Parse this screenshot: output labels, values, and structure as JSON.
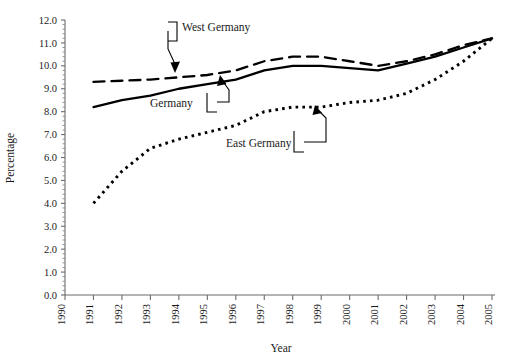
{
  "figure": {
    "background_color": "#ffffff",
    "ink_color": "#000000",
    "axis_color": "#6b6b6b",
    "text_color": "#1a1a1a"
  },
  "axes": {
    "ylabel": "Percentage",
    "xlabel": "Year",
    "y_ticks": [
      "0.0",
      "1.0",
      "2.0",
      "3.0",
      "4.0",
      "5.0",
      "6.0",
      "7.0",
      "8.0",
      "9.0",
      "10.0",
      "11.0",
      "12.0"
    ],
    "x_ticks": [
      "1990",
      "1991",
      "1992",
      "1993",
      "1994",
      "1995",
      "1996",
      "1997",
      "1998",
      "1999",
      "2000",
      "2001",
      "2002",
      "2003",
      "2004",
      "2005"
    ],
    "y_minor_ticks_per_interval": 5,
    "grid": false
  },
  "annotations": [
    {
      "name": "west-germany",
      "label": "West Germany"
    },
    {
      "name": "germany",
      "label": "Germany"
    },
    {
      "name": "east-germany",
      "label": "East Germany"
    }
  ],
  "chart_data": {
    "type": "line",
    "title": "",
    "subtitle": "",
    "xlabel": "Year",
    "ylabel": "Percentage",
    "xlim": [
      1990,
      2005
    ],
    "ylim": [
      0.0,
      12.0
    ],
    "ytick_step": 1.0,
    "xtick_step": 1,
    "grid": false,
    "legend": "inline-annotations",
    "x": [
      1991,
      1992,
      1993,
      1994,
      1995,
      1996,
      1997,
      1998,
      1999,
      2000,
      2001,
      2002,
      2003,
      2004,
      2005
    ],
    "series": [
      {
        "name": "West Germany",
        "style": "dashed",
        "color": "#000000",
        "values": [
          9.3,
          9.35,
          9.4,
          9.5,
          9.6,
          9.8,
          10.2,
          10.4,
          10.4,
          10.2,
          10.0,
          10.2,
          10.5,
          10.9,
          11.2
        ]
      },
      {
        "name": "Germany",
        "style": "solid",
        "color": "#000000",
        "values": [
          8.2,
          8.5,
          8.7,
          9.0,
          9.2,
          9.4,
          9.8,
          10.0,
          10.0,
          9.9,
          9.8,
          10.1,
          10.4,
          10.8,
          11.2
        ]
      },
      {
        "name": "East Germany",
        "style": "dotted",
        "color": "#000000",
        "values": [
          4.0,
          5.4,
          6.4,
          6.8,
          7.1,
          7.4,
          8.0,
          8.2,
          8.2,
          8.4,
          8.5,
          8.8,
          9.4,
          10.2,
          11.2
        ]
      }
    ]
  }
}
